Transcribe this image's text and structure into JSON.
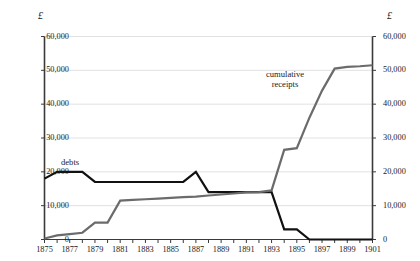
{
  "chart_data": {
    "type": "line",
    "title": "",
    "subtitle": "",
    "xlabel": "",
    "ylabel": "£",
    "ylabel_right": "£",
    "grid": true,
    "legend_position": "inline-annotations",
    "xlim": [
      1875,
      1901
    ],
    "ylim": [
      0,
      60000
    ],
    "yticks": [
      0,
      10000,
      20000,
      30000,
      40000,
      50000,
      60000
    ],
    "ytick_labels": [
      "0",
      "10,000",
      "20,000",
      "30,000",
      "40,000",
      "50,000",
      "60,000"
    ],
    "ytick_labels_right": [
      "0",
      "10,000",
      "20,000",
      "30,000",
      "40,000",
      "50,000",
      "60,000"
    ],
    "xticks": [
      1875,
      1876,
      1877,
      1878,
      1879,
      1880,
      1881,
      1882,
      1883,
      1884,
      1885,
      1886,
      1887,
      1888,
      1889,
      1890,
      1891,
      1892,
      1893,
      1894,
      1895,
      1896,
      1897,
      1898,
      1899,
      1900,
      1901
    ],
    "xtick_labels_shown": [
      "1875",
      "1877",
      "1879",
      "1881",
      "1883",
      "1885",
      "1887",
      "1889",
      "1891",
      "1893",
      "1895",
      "1897",
      "1899",
      "1901"
    ],
    "series": [
      {
        "name": "debts",
        "color": "#111111",
        "label": "debts",
        "x": [
          1875,
          1876,
          1877,
          1878,
          1879,
          1880,
          1881,
          1882,
          1883,
          1884,
          1885,
          1886,
          1887,
          1888,
          1889,
          1890,
          1891,
          1892,
          1893,
          1894,
          1895,
          1896,
          1897,
          1898,
          1899,
          1900,
          1901
        ],
        "values": [
          18000,
          20000,
          20000,
          20000,
          17000,
          17000,
          17000,
          17000,
          17000,
          17000,
          17000,
          17000,
          20000,
          14000,
          14000,
          14000,
          14000,
          14000,
          14000,
          3000,
          3000,
          0,
          0,
          0,
          0,
          0,
          0
        ]
      },
      {
        "name": "cumulative receipts",
        "color": "#6b6b6b",
        "label": "cumulative\nreceipts",
        "label_line1": "cumulative",
        "label_line2": "receipts",
        "x": [
          1875,
          1876,
          1877,
          1878,
          1879,
          1880,
          1881,
          1882,
          1883,
          1884,
          1885,
          1886,
          1887,
          1888,
          1889,
          1890,
          1891,
          1892,
          1893,
          1894,
          1895,
          1896,
          1897,
          1898,
          1899,
          1900,
          1901
        ],
        "values": [
          300,
          1200,
          1600,
          2000,
          5000,
          5000,
          11500,
          11700,
          11900,
          12100,
          12300,
          12500,
          12700,
          13000,
          13300,
          13600,
          13900,
          14000,
          14500,
          26500,
          27000,
          36000,
          44000,
          50500,
          51000,
          51200,
          51500
        ]
      }
    ]
  },
  "axes": {
    "left_unit": "£",
    "right_unit": "£",
    "y_labels": [
      "60,000",
      "50,000",
      "40,000",
      "30,000",
      "20,000",
      "10,000",
      "0"
    ],
    "x_labels": [
      "1875",
      "1877",
      "1879",
      "1881",
      "1883",
      "1885",
      "1887",
      "1889",
      "1891",
      "1893",
      "1895",
      "1897",
      "1899",
      "1901"
    ]
  },
  "annotations": {
    "debts": "debts",
    "receipts_line1": "cumulative",
    "receipts_line2": "receipts"
  },
  "colors": {
    "debts_line": "#111111",
    "receipts_line": "#6b6b6b",
    "grid": "#d9d9d9",
    "axis": "#3a3a3a",
    "text": "#1a1a1a",
    "background": "#ffffff"
  }
}
